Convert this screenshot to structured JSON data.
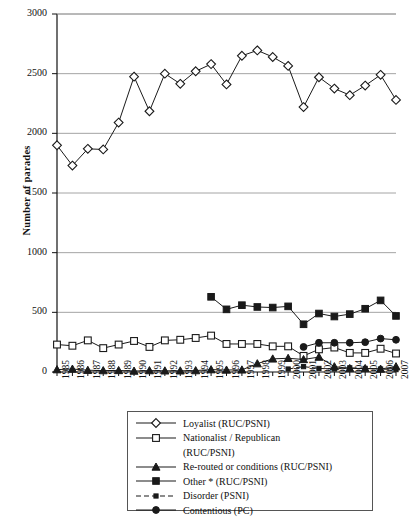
{
  "chart_data": {
    "type": "line",
    "title": "",
    "xlabel": "",
    "ylabel": "Number of parades",
    "ylim": [
      0,
      3000
    ],
    "ytick_values": [
      0,
      500,
      1000,
      1500,
      2000,
      2500,
      3000
    ],
    "ytick_labels": [
      "0",
      "500",
      "1000",
      "1500",
      "2000",
      "2500",
      "3000"
    ],
    "grid": "horizontal",
    "legend_position": "below-axes",
    "x": [
      1985,
      1986,
      1987,
      1988,
      1989,
      1990,
      1991,
      1992,
      1993,
      1994,
      1995,
      1996,
      1997,
      1998,
      1999,
      2000,
      2001,
      2002,
      2003,
      2004,
      2005,
      2006,
      2007
    ],
    "xtick_labels": [
      "1985",
      "1986",
      "1987",
      "1988",
      "1989",
      "1990",
      "1991",
      "1992",
      "1993",
      "1994",
      "1995",
      "1996",
      "1997",
      "1998",
      "1999",
      "2000",
      "2001",
      "2002",
      "2003",
      "2004",
      "2005",
      "2006",
      "2007"
    ],
    "series": [
      {
        "name": "Loyalist (RUC/PSNI)",
        "marker": "open-diamond",
        "line": "solid",
        "values": [
          1900,
          1730,
          1870,
          1865,
          2090,
          2475,
          2185,
          2500,
          2415,
          2520,
          2580,
          2410,
          2650,
          2695,
          2640,
          2565,
          2220,
          2470,
          2375,
          2320,
          2400,
          2490,
          2280
        ]
      },
      {
        "name": "Nationalist / Republican (RUC/PSNI)",
        "marker": "open-square",
        "line": "solid",
        "values": [
          230,
          220,
          265,
          200,
          230,
          260,
          210,
          265,
          270,
          285,
          305,
          235,
          235,
          235,
          215,
          215,
          135,
          190,
          205,
          160,
          160,
          195,
          155
        ]
      },
      {
        "name": "Re-routed or conditions (RUC/PSNI)",
        "marker": "filled-triangle",
        "line": "solid",
        "values": [
          20,
          25,
          15,
          12,
          13,
          8,
          12,
          10,
          10,
          12,
          20,
          17,
          18,
          70,
          110,
          115,
          105,
          125,
          45,
          30,
          30,
          25,
          45
        ]
      },
      {
        "name": "Other * (RUC/PSNI)",
        "marker": "filled-square",
        "line": "solid",
        "values": [
          null,
          null,
          null,
          null,
          null,
          null,
          null,
          null,
          null,
          null,
          630,
          525,
          560,
          545,
          540,
          550,
          400,
          490,
          465,
          485,
          530,
          600,
          470
        ]
      },
      {
        "name": "Disorder (PSNI)",
        "marker": "filled-small",
        "line": "dashed",
        "values": [
          null,
          null,
          null,
          null,
          null,
          null,
          null,
          null,
          null,
          null,
          null,
          null,
          null,
          null,
          null,
          25,
          45,
          30,
          25,
          35,
          30,
          25,
          20
        ]
      },
      {
        "name": "Contentious (PC)",
        "marker": "filled-circle",
        "line": "solid",
        "values": [
          null,
          null,
          null,
          null,
          null,
          null,
          null,
          null,
          null,
          null,
          null,
          null,
          null,
          null,
          null,
          null,
          210,
          245,
          245,
          245,
          250,
          280,
          270
        ]
      }
    ]
  },
  "legend": {
    "items": [
      {
        "label": "Loyalist (RUC/PSNI)",
        "label2": null,
        "key": "open-diamond",
        "dash": false
      },
      {
        "label": "Nationalist / Republican",
        "label2": "(RUC/PSNI)",
        "key": "open-square",
        "dash": false
      },
      {
        "label": "Re-routed or conditions (RUC/PSNI)",
        "label2": null,
        "key": "filled-triangle",
        "dash": false
      },
      {
        "label": "Other * (RUC/PSNI)",
        "label2": null,
        "key": "filled-square",
        "dash": false
      },
      {
        "label": "Disorder (PSNI)",
        "label2": null,
        "key": "filled-small",
        "dash": true
      },
      {
        "label": "Contentious (PC)",
        "label2": null,
        "key": "filled-circle",
        "dash": false
      }
    ]
  },
  "colors": {
    "axis": "#111111",
    "grid": "#9a9a9a",
    "line": "#1a1a1a",
    "background": "#ffffff"
  }
}
